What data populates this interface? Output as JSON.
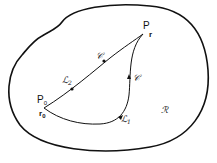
{
  "diagram": {
    "region_label": "ℛ",
    "end_point": {
      "label": "P",
      "vector": "r"
    },
    "start_point": {
      "label": "P",
      "label_sub": "0",
      "vector": "r",
      "vector_sub": "0"
    },
    "upper_path": {
      "curve_label": "𝒞",
      "path_label": "ℒ",
      "path_sub": "2"
    },
    "lower_path": {
      "curve_label": "𝒞",
      "path_label": "ℒ",
      "path_sub": "1"
    },
    "colors": {
      "stroke": "#111111",
      "background": "#ffffff"
    }
  }
}
